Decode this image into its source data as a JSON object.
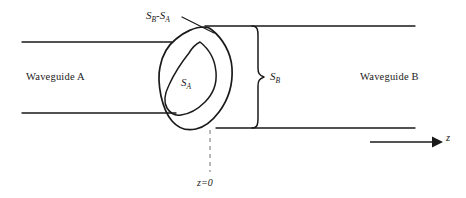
{
  "figure": {
    "type": "technical-diagram",
    "background_color": "#ffffff",
    "line_color": "#1a1a1a",
    "dashed_line_color": "#7a7a7a"
  },
  "labels": {
    "waveguide_a": "Waveguide A",
    "waveguide_b": "Waveguide B",
    "region_difference": "S",
    "region_difference_sub1": "B",
    "region_difference_dash": "-",
    "region_difference_s2": "S",
    "region_difference_sub2": "A",
    "area_a": "S",
    "area_a_sub": "A",
    "area_b": "S",
    "area_b_sub": "B",
    "axis_z": "z",
    "origin": "z=0"
  },
  "geometry": {
    "waveguide_a": {
      "top_line_y": 42,
      "bottom_line_y": 113,
      "x_start": 22,
      "x_end": 172
    },
    "waveguide_b": {
      "top_line_y": 26,
      "bottom_line_y": 128,
      "x_start": 205,
      "x_end": 415
    },
    "brace_sb": {
      "x": 256,
      "y_top": 26,
      "y_bottom": 128
    },
    "axis_arrow": {
      "x_start": 370,
      "x_end": 438,
      "y": 142
    },
    "dashed_origin_line": {
      "x": 210,
      "y_top": 130,
      "y_bottom": 172
    },
    "leader_line": {
      "x_start": 182,
      "y_start": 18,
      "x_end": 212,
      "y_end": 32
    }
  }
}
